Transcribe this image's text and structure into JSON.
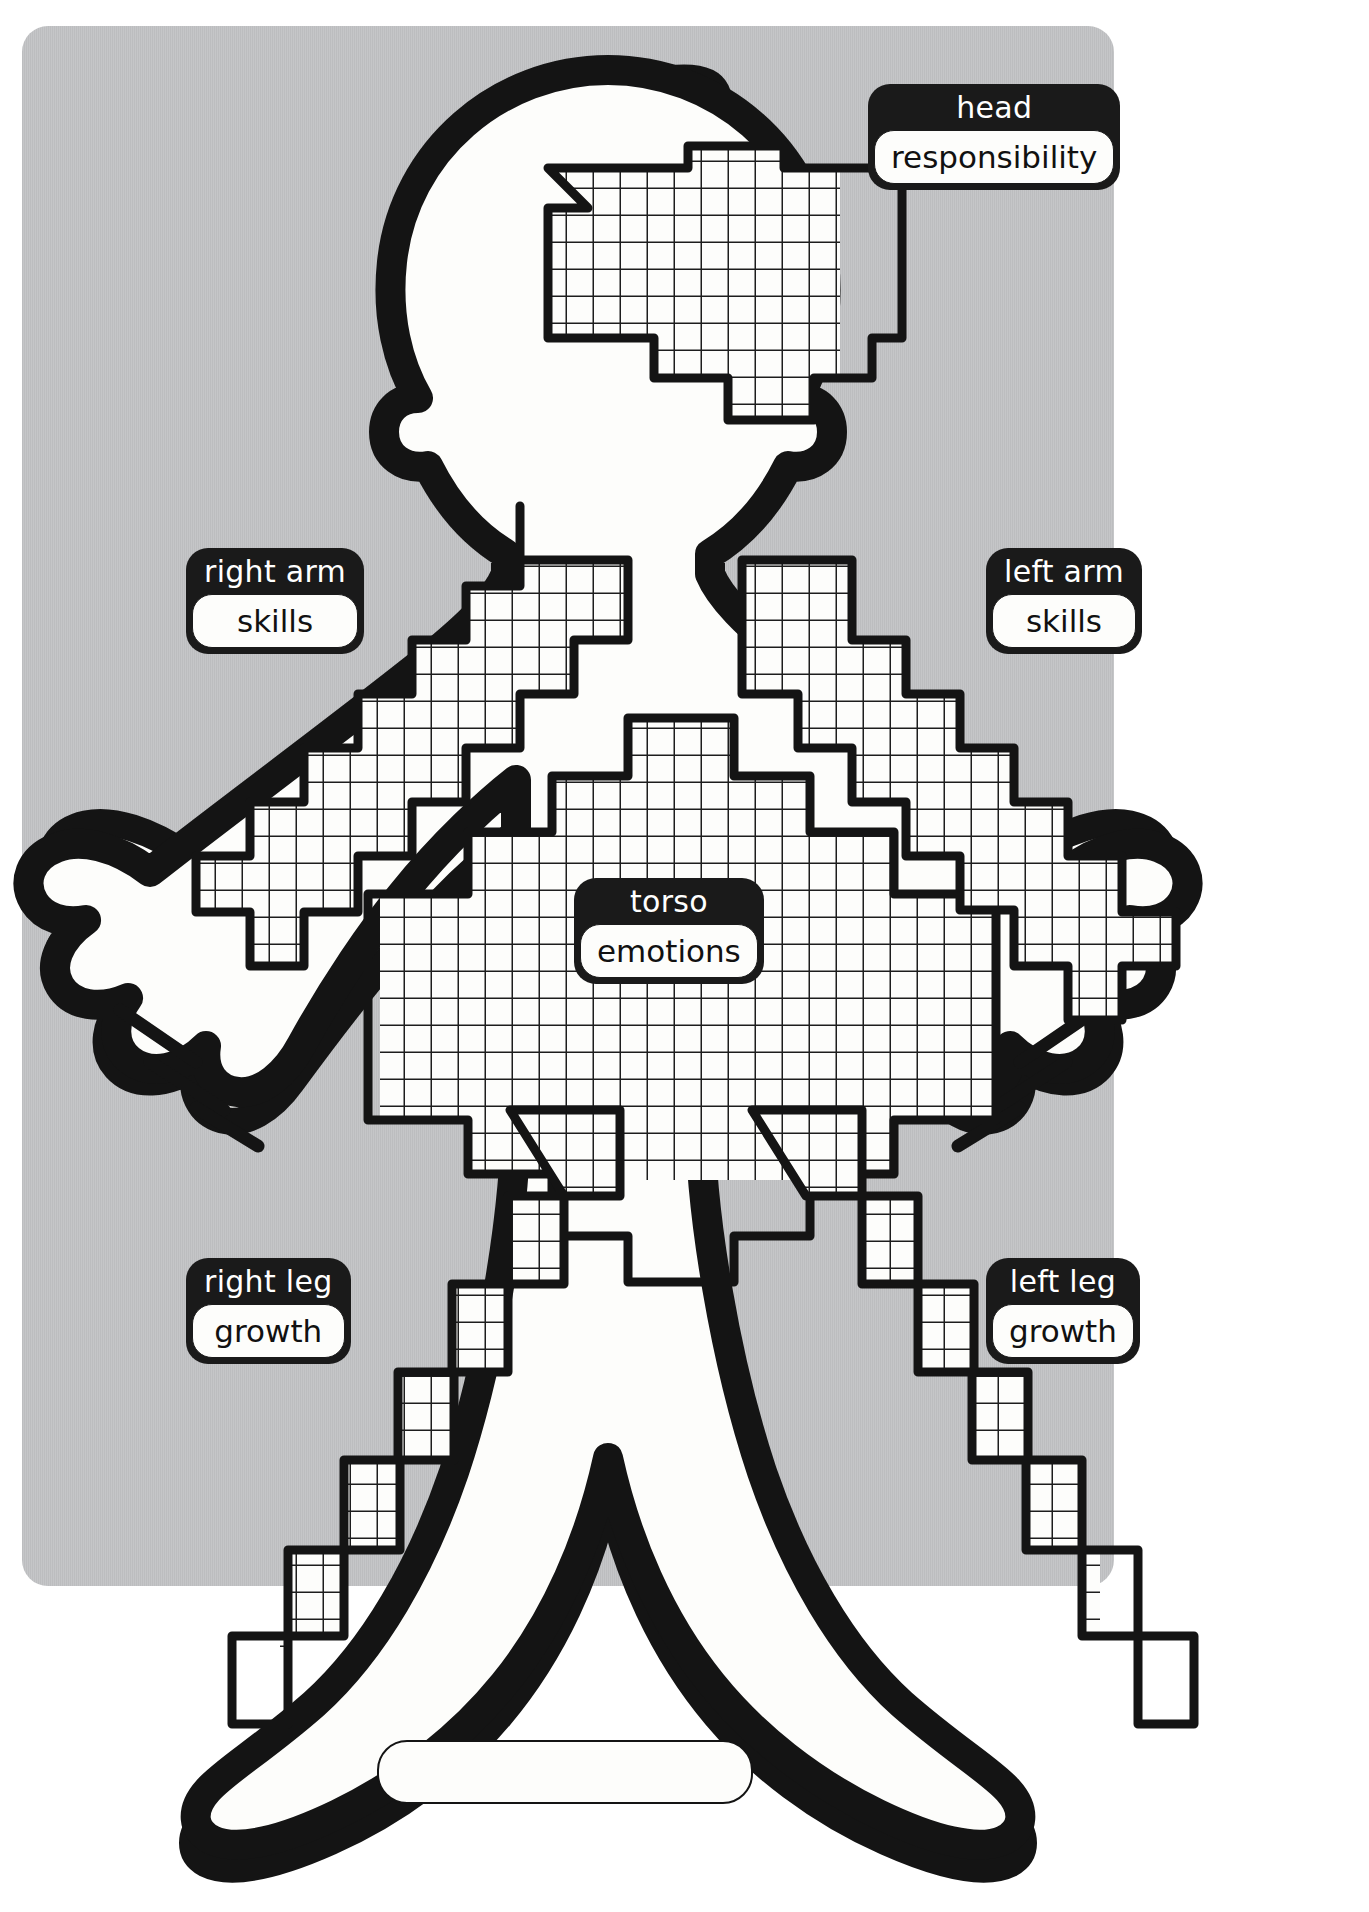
{
  "worksheet": {
    "title": "Body outline worksheet",
    "background_color": "#c3c4c6",
    "ink_color": "#161616",
    "paper_color": "#fdfdfb"
  },
  "labels": [
    {
      "id": "head",
      "part": "head",
      "value": "responsibility"
    },
    {
      "id": "right_arm",
      "part": "right arm",
      "value": "skills"
    },
    {
      "id": "left_arm",
      "part": "left arm",
      "value": "skills"
    },
    {
      "id": "torso",
      "part": "torso",
      "value": "emotions"
    },
    {
      "id": "right_leg",
      "part": "right leg",
      "value": "growth"
    },
    {
      "id": "left_leg",
      "part": "left leg",
      "value": "growth"
    }
  ],
  "name_field": {
    "label": "name",
    "value": "",
    "placeholder": ""
  },
  "grids": {
    "description": "square-cell graph paper regions filling head, arms, torso and legs",
    "cell_size_px": 27,
    "regions": [
      "head",
      "right-arm",
      "left-arm",
      "torso",
      "right-leg",
      "left-leg"
    ]
  }
}
